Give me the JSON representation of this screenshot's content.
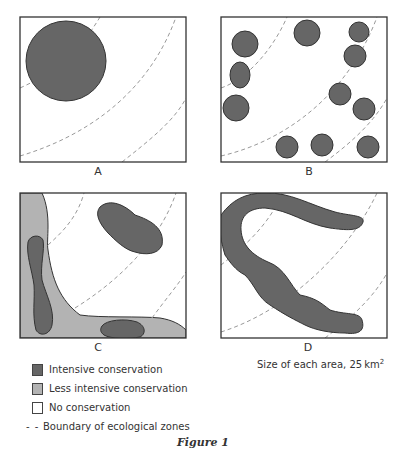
{
  "figure": {
    "caption": "Figure 1",
    "panels": [
      {
        "id": "A",
        "label": "A",
        "description": "Single large circular intensive conservation area"
      },
      {
        "id": "B",
        "label": "B",
        "description": "Eleven small scattered intensive conservation areas"
      },
      {
        "id": "C",
        "label": "C",
        "description": "Three intensive areas within an L-shaped less intensive conservation buffer"
      },
      {
        "id": "D",
        "label": "D",
        "description": "One continuous winding corridor of intensive conservation"
      }
    ],
    "size_note": {
      "text": "Size of each area, 25 km",
      "superscript": "2"
    }
  },
  "legend": {
    "items": [
      {
        "label": "Intensive conservation",
        "color": "#666666"
      },
      {
        "label": "Less intensive conservation",
        "color": "#b3b3b3"
      },
      {
        "label": "No conservation",
        "color": "#ffffff"
      },
      {
        "label": "Boundary of ecological zones",
        "symbol": "- -"
      }
    ]
  },
  "colors": {
    "intensive": "#666666",
    "less_intensive": "#b3b3b3",
    "outline": "#333333",
    "boundary": "#999999"
  }
}
